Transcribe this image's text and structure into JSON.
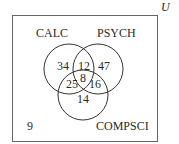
{
  "diagram": {
    "type": "venn-3",
    "universe_label": "U",
    "sets": [
      {
        "name": "CALC"
      },
      {
        "name": "PSYCH"
      },
      {
        "name": "COMPSCI"
      }
    ],
    "regions": {
      "calc_only": "34",
      "psych_only": "47",
      "compsci_only": "14",
      "calc_psych_only": "12",
      "calc_compsci_only": "25",
      "psych_compsci_only": "16",
      "all_three": "8",
      "outside": "9"
    },
    "colors": {
      "stroke": "#3a3a3a",
      "box_stroke": "#555555",
      "text": "#2a2a2a"
    }
  }
}
